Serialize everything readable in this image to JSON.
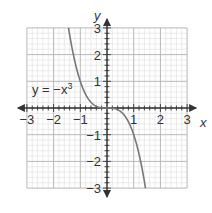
{
  "chart_data": {
    "type": "line",
    "title": "",
    "xlabel": "x",
    "ylabel": "y",
    "xlim": [
      -3,
      3
    ],
    "ylim": [
      -3,
      3
    ],
    "grid": true,
    "minor_divisions_per_unit": 5,
    "x_ticks": [
      -3,
      -2,
      -1,
      1,
      2,
      3
    ],
    "y_ticks": [
      3,
      2,
      1,
      -1,
      -2,
      -3
    ],
    "x_tick_labels": [
      "−3",
      "−2",
      "−1",
      "1",
      "2",
      "3"
    ],
    "y_tick_labels": [
      "3",
      "2",
      "1",
      "−1",
      "−2",
      "−3"
    ],
    "series": [
      {
        "name": "y = −x³",
        "function": "-x^3",
        "x_domain": [
          -1.442,
          1.442
        ],
        "color": "#777777"
      }
    ],
    "annotations": [
      {
        "text": "y = −x",
        "superscript": "3",
        "x": -2.5,
        "y": 0.45
      }
    ]
  }
}
